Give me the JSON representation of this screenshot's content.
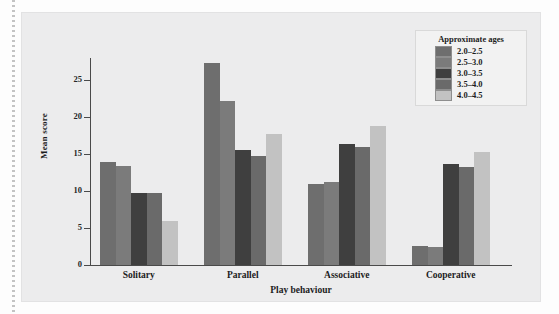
{
  "figure": {
    "background_color": "#ececed",
    "page_background": "#fdfdfd"
  },
  "legend": {
    "title": "Approximate ages",
    "position": "top-right",
    "entries": [
      {
        "label": "2.0–2.5",
        "color": "#6e6e6e"
      },
      {
        "label": "2.5–3.0",
        "color": "#7b7b7b"
      },
      {
        "label": "3.0–3.5",
        "color": "#3f3f3f"
      },
      {
        "label": "3.5–4.0",
        "color": "#6a6a6a"
      },
      {
        "label": "4.0–4.5",
        "color": "#c2c2c2"
      }
    ]
  },
  "chart_data": {
    "type": "bar",
    "title": "",
    "xlabel": "Play behaviour",
    "ylabel": "Mean score",
    "categories": [
      "Solitary",
      "Parallel",
      "Associative",
      "Cooperative"
    ],
    "ylim": [
      0,
      28
    ],
    "yticks": [
      0,
      5,
      10,
      15,
      20,
      25
    ],
    "ytick_labels": [
      "0",
      "5",
      "10",
      "15",
      "20",
      "25"
    ],
    "grid": false,
    "legend_title": "Approximate ages",
    "series": [
      {
        "name": "2.0–2.5",
        "color": "#6e6e6e",
        "values": [
          14.0,
          27.3,
          10.9,
          2.6
        ]
      },
      {
        "name": "2.5–3.0",
        "color": "#7b7b7b",
        "values": [
          13.4,
          22.2,
          11.2,
          2.4
        ]
      },
      {
        "name": "3.0–3.5",
        "color": "#3f3f3f",
        "values": [
          9.7,
          15.6,
          16.3,
          13.6
        ]
      },
      {
        "name": "3.5–4.0",
        "color": "#6a6a6a",
        "values": [
          9.7,
          14.8,
          15.9,
          13.2
        ]
      },
      {
        "name": "4.0–4.5",
        "color": "#c2c2c2",
        "values": [
          6.0,
          17.7,
          18.8,
          15.3
        ]
      }
    ]
  }
}
